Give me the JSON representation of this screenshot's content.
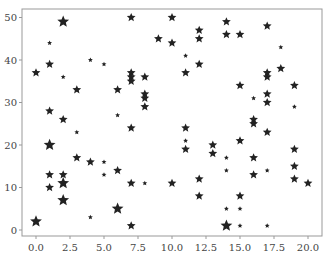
{
  "chart_data": {
    "type": "scatter",
    "title": "",
    "xlabel": "",
    "ylabel": "",
    "xlim": [
      -1,
      21
    ],
    "ylim": [
      -1,
      52
    ],
    "grid": false,
    "legend": null,
    "marker": "star",
    "marker_color": "#222222",
    "x_ticks": [
      "0.0",
      "2.5",
      "5.0",
      "7.5",
      "10.0",
      "12.5",
      "15.0",
      "17.5",
      "20.0"
    ],
    "x_tick_values": [
      0,
      2.5,
      5,
      7.5,
      10,
      12.5,
      15,
      17.5,
      20
    ],
    "y_ticks": [
      "0",
      "10",
      "20",
      "30",
      "40",
      "50"
    ],
    "y_tick_values": [
      0,
      10,
      20,
      30,
      40,
      50
    ],
    "points": [
      {
        "x": 0,
        "y": 2,
        "size": "l"
      },
      {
        "x": 0,
        "y": 37,
        "size": "m"
      },
      {
        "x": 1,
        "y": 44,
        "size": "s"
      },
      {
        "x": 1,
        "y": 39,
        "size": "m"
      },
      {
        "x": 1,
        "y": 28,
        "size": "m"
      },
      {
        "x": 1,
        "y": 20,
        "size": "l"
      },
      {
        "x": 1,
        "y": 13,
        "size": "m"
      },
      {
        "x": 1,
        "y": 10,
        "size": "m"
      },
      {
        "x": 2,
        "y": 49,
        "size": "l"
      },
      {
        "x": 2,
        "y": 36,
        "size": "s"
      },
      {
        "x": 2,
        "y": 26,
        "size": "m"
      },
      {
        "x": 2,
        "y": 13,
        "size": "m"
      },
      {
        "x": 2,
        "y": 11,
        "size": "l"
      },
      {
        "x": 2,
        "y": 7,
        "size": "l"
      },
      {
        "x": 3,
        "y": 33,
        "size": "m"
      },
      {
        "x": 3,
        "y": 23,
        "size": "s"
      },
      {
        "x": 3,
        "y": 17,
        "size": "m"
      },
      {
        "x": 4,
        "y": 40,
        "size": "s"
      },
      {
        "x": 4,
        "y": 16,
        "size": "m"
      },
      {
        "x": 4,
        "y": 3,
        "size": "s"
      },
      {
        "x": 5,
        "y": 39,
        "size": "s"
      },
      {
        "x": 5,
        "y": 16,
        "size": "s"
      },
      {
        "x": 5,
        "y": 13,
        "size": "s"
      },
      {
        "x": 6,
        "y": 33,
        "size": "m"
      },
      {
        "x": 6,
        "y": 27,
        "size": "s"
      },
      {
        "x": 6,
        "y": 14,
        "size": "m"
      },
      {
        "x": 6,
        "y": 5,
        "size": "l"
      },
      {
        "x": 7,
        "y": 50,
        "size": "m"
      },
      {
        "x": 7,
        "y": 37,
        "size": "m"
      },
      {
        "x": 7,
        "y": 36,
        "size": "m"
      },
      {
        "x": 7,
        "y": 35,
        "size": "m"
      },
      {
        "x": 7,
        "y": 24,
        "size": "m"
      },
      {
        "x": 7,
        "y": 11,
        "size": "m"
      },
      {
        "x": 7,
        "y": 1,
        "size": "m"
      },
      {
        "x": 8,
        "y": 36,
        "size": "m"
      },
      {
        "x": 8,
        "y": 32,
        "size": "m"
      },
      {
        "x": 8,
        "y": 31,
        "size": "m"
      },
      {
        "x": 8,
        "y": 29,
        "size": "m"
      },
      {
        "x": 8,
        "y": 11,
        "size": "s"
      },
      {
        "x": 9,
        "y": 45,
        "size": "m"
      },
      {
        "x": 10,
        "y": 50,
        "size": "m"
      },
      {
        "x": 10,
        "y": 44,
        "size": "m"
      },
      {
        "x": 10,
        "y": 11,
        "size": "m"
      },
      {
        "x": 11,
        "y": 41,
        "size": "s"
      },
      {
        "x": 11,
        "y": 37,
        "size": "m"
      },
      {
        "x": 11,
        "y": 24,
        "size": "m"
      },
      {
        "x": 11,
        "y": 21,
        "size": "s"
      },
      {
        "x": 11,
        "y": 19,
        "size": "m"
      },
      {
        "x": 12,
        "y": 47,
        "size": "m"
      },
      {
        "x": 12,
        "y": 45,
        "size": "m"
      },
      {
        "x": 12,
        "y": 39,
        "size": "m"
      },
      {
        "x": 12,
        "y": 12,
        "size": "m"
      },
      {
        "x": 12,
        "y": 8,
        "size": "m"
      },
      {
        "x": 13,
        "y": 20,
        "size": "m"
      },
      {
        "x": 13,
        "y": 18,
        "size": "m"
      },
      {
        "x": 14,
        "y": 49,
        "size": "m"
      },
      {
        "x": 14,
        "y": 46,
        "size": "m"
      },
      {
        "x": 14,
        "y": 17,
        "size": "s"
      },
      {
        "x": 14,
        "y": 14,
        "size": "s"
      },
      {
        "x": 14,
        "y": 5,
        "size": "s"
      },
      {
        "x": 14,
        "y": 1,
        "size": "l"
      },
      {
        "x": 15,
        "y": 46,
        "size": "m"
      },
      {
        "x": 15,
        "y": 34,
        "size": "m"
      },
      {
        "x": 15,
        "y": 21,
        "size": "m"
      },
      {
        "x": 15,
        "y": 8,
        "size": "m"
      },
      {
        "x": 15,
        "y": 5,
        "size": "s"
      },
      {
        "x": 15,
        "y": 1,
        "size": "s"
      },
      {
        "x": 16,
        "y": 31,
        "size": "s"
      },
      {
        "x": 16,
        "y": 26,
        "size": "m"
      },
      {
        "x": 16,
        "y": 25,
        "size": "m"
      },
      {
        "x": 16,
        "y": 17,
        "size": "m"
      },
      {
        "x": 16,
        "y": 13,
        "size": "m"
      },
      {
        "x": 17,
        "y": 48,
        "size": "m"
      },
      {
        "x": 17,
        "y": 37,
        "size": "m"
      },
      {
        "x": 17,
        "y": 36,
        "size": "m"
      },
      {
        "x": 17,
        "y": 32,
        "size": "m"
      },
      {
        "x": 17,
        "y": 30,
        "size": "m"
      },
      {
        "x": 17,
        "y": 23,
        "size": "m"
      },
      {
        "x": 17,
        "y": 14,
        "size": "s"
      },
      {
        "x": 17,
        "y": 1,
        "size": "s"
      },
      {
        "x": 18,
        "y": 43,
        "size": "s"
      },
      {
        "x": 18,
        "y": 38,
        "size": "m"
      },
      {
        "x": 19,
        "y": 34,
        "size": "m"
      },
      {
        "x": 19,
        "y": 29,
        "size": "s"
      },
      {
        "x": 19,
        "y": 19,
        "size": "m"
      },
      {
        "x": 19,
        "y": 15,
        "size": "m"
      },
      {
        "x": 19,
        "y": 12,
        "size": "m"
      },
      {
        "x": 20,
        "y": 11,
        "size": "m"
      }
    ]
  }
}
